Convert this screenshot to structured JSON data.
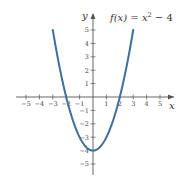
{
  "chart_data": {
    "type": "line",
    "title_parts": {
      "lhs": "f(x) = x",
      "exponent": "2",
      "rhs": " − 4"
    },
    "xlabel": "x",
    "ylabel": "y",
    "xlim": [
      -5.5,
      5.8
    ],
    "ylim": [
      -5.7,
      5.8
    ],
    "grid": false,
    "x_ticks": [
      -5,
      -4,
      -3,
      -2,
      -1,
      1,
      2,
      3,
      4,
      5
    ],
    "x_tick_labels": [
      "−5",
      "−4",
      "−3",
      "−2",
      "−1",
      "1",
      "2",
      "3",
      "4",
      "5"
    ],
    "y_ticks": [
      5,
      4,
      3,
      2,
      1,
      -1,
      -2,
      -3,
      -4,
      -5
    ],
    "y_tick_labels": [
      "5",
      "4",
      "3",
      "2",
      "1",
      "−1",
      "−2",
      "−3",
      "−4",
      "−5"
    ],
    "series": [
      {
        "name": "f(x) = x^2 - 4",
        "color": "#3f6f9a",
        "x": [
          -3,
          -2.5,
          -2,
          -1.5,
          -1,
          -0.5,
          0,
          0.5,
          1,
          1.5,
          2,
          2.5,
          3
        ],
        "y": [
          5,
          2.25,
          0,
          -1.75,
          -3,
          -3.75,
          -4,
          -3.75,
          -3,
          -1.75,
          0,
          2.25,
          5
        ]
      }
    ]
  },
  "colors": {
    "curve": "#3f6f9a",
    "axis": "#555555",
    "text": "#333333"
  }
}
